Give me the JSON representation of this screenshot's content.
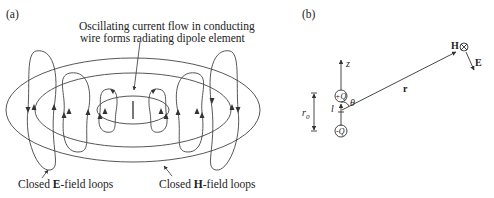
{
  "panel_a": {
    "label": "(a)",
    "caption_line1": "Oscillating current flow in conducting",
    "caption_line2": "wire forms radiating dipole element",
    "e_loops_label_prefix": "Closed ",
    "e_loops_label_bold": "E",
    "e_loops_label_suffix": "-field loops",
    "h_loops_label_prefix": "Closed ",
    "h_loops_label_bold": "H",
    "h_loops_label_suffix": "-field loops"
  },
  "panel_b": {
    "label": "(b)",
    "axis_z": "z",
    "charge_pos": "+Q",
    "charge_neg": "-Q",
    "length_l": "l",
    "angle_theta": "θ",
    "vector_r": "r",
    "distance_r0": "r",
    "distance_r0_sub": "0",
    "field_H": "H",
    "field_E": "E"
  },
  "colors": {
    "line": "#333333",
    "text": "#222222",
    "background": "#ffffff"
  }
}
